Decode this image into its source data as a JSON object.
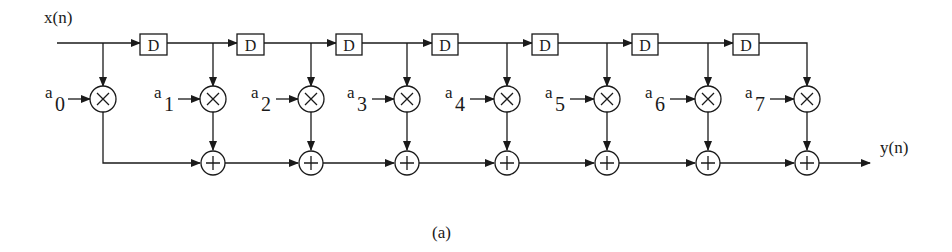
{
  "diagram": {
    "input_label": "x(n)",
    "output_label": "y(n)",
    "caption": "(a)",
    "delay_label": "D",
    "multiplier_symbol": "×",
    "adder_symbol": "+",
    "coefficients": [
      {
        "base": "a",
        "index": "0"
      },
      {
        "base": "a",
        "index": "1"
      },
      {
        "base": "a",
        "index": "2"
      },
      {
        "base": "a",
        "index": "3"
      },
      {
        "base": "a",
        "index": "4"
      },
      {
        "base": "a",
        "index": "5"
      },
      {
        "base": "a",
        "index": "6"
      },
      {
        "base": "a",
        "index": "7"
      }
    ],
    "num_taps": 8,
    "num_delays": 7,
    "line_color": "#1a1a1a",
    "background": "#ffffff"
  }
}
